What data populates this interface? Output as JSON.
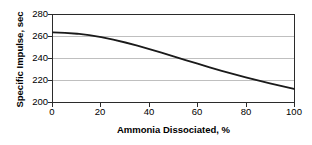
{
  "chart_data": {
    "type": "line",
    "title": "",
    "xlabel": "Ammonia Dissociated, %",
    "ylabel": "Specific Impulse, sec",
    "xlim": [
      0,
      100
    ],
    "ylim": [
      200,
      280
    ],
    "xticks": [
      0,
      20,
      40,
      60,
      80,
      100
    ],
    "yticks": [
      200,
      220,
      240,
      260,
      280
    ],
    "grid": "horizontal",
    "legend": "none",
    "line_color": "#1a1a1a",
    "series": [
      {
        "name": "Specific Impulse",
        "x": [
          0,
          5,
          10,
          15,
          20,
          25,
          30,
          35,
          40,
          45,
          50,
          55,
          60,
          65,
          70,
          75,
          80,
          85,
          90,
          95,
          100
        ],
        "values": [
          264,
          263.6,
          262.8,
          261.5,
          259.6,
          257.3,
          254.7,
          251.8,
          248.7,
          245.4,
          242.0,
          238.6,
          235.2,
          231.9,
          228.7,
          225.6,
          222.6,
          219.8,
          217.2,
          214.6,
          212.0
        ]
      }
    ]
  },
  "axes": {
    "ytick_labels": [
      "280",
      "260",
      "240",
      "220",
      "200"
    ],
    "xtick_labels": [
      "0",
      "20",
      "40",
      "60",
      "80",
      "100"
    ]
  }
}
